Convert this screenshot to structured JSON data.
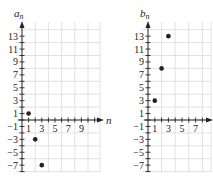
{
  "chart_data": [
    {
      "type": "scatter",
      "title": "",
      "xlabel": "n",
      "ylabel": "a_n",
      "ylabel_main": "a",
      "ylabel_sub": "n",
      "x_ticks": [
        1,
        3,
        5,
        7,
        9
      ],
      "y_ticks": [
        13,
        11,
        9,
        7,
        5,
        3,
        1,
        -1,
        -3,
        -5,
        -7
      ],
      "xlim": [
        0,
        10
      ],
      "ylim": [
        -8,
        14
      ],
      "grid": true,
      "points": [
        {
          "x": 1,
          "y": 1
        },
        {
          "x": 2,
          "y": -3
        },
        {
          "x": 3,
          "y": -7
        }
      ]
    },
    {
      "type": "scatter",
      "title": "",
      "xlabel": "",
      "ylabel": "b_n",
      "ylabel_main": "b",
      "ylabel_sub": "n",
      "x_ticks": [
        1,
        3,
        5,
        7
      ],
      "y_ticks": [
        13,
        11,
        9,
        7,
        5,
        3,
        1,
        -1,
        -3,
        -5,
        -7
      ],
      "xlim": [
        0,
        9
      ],
      "ylim": [
        -8,
        14
      ],
      "grid": true,
      "points": [
        {
          "x": 1,
          "y": 3
        },
        {
          "x": 2,
          "y": 8
        },
        {
          "x": 3,
          "y": 13
        }
      ]
    }
  ],
  "colors": {
    "axis": "#222222",
    "grid": "#d9d9d9",
    "point": "#222222"
  }
}
